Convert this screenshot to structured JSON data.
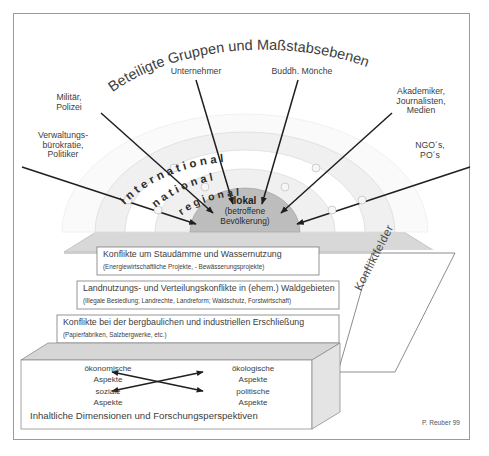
{
  "figure": {
    "title": "Beteiligte Gruppen und Maßstabsebenen",
    "signature": "P. Reuber 99",
    "side_label": "Konfliktfelder",
    "caption": "Inhaltliche Dimensionen und Forschungsperspektiven"
  },
  "actors": [
    {
      "id": "verwaltung",
      "label": "Verwaltungs-\nbürokratie,\nPolitiker"
    },
    {
      "id": "militaer",
      "label": "Militär,\nPolizei"
    },
    {
      "id": "unternehmer",
      "label": "Unternehmer"
    },
    {
      "id": "moenche",
      "label": "Buddh. Mönche"
    },
    {
      "id": "akademiker",
      "label": "Akademiker,\nJournalisten,\nMedien"
    },
    {
      "id": "ngo",
      "label": "NGO´s,\nPO´s"
    }
  ],
  "scales": {
    "bands": [
      {
        "id": "international",
        "label": "international"
      },
      {
        "id": "national",
        "label": "national"
      },
      {
        "id": "regional",
        "label": "regional"
      }
    ],
    "center": {
      "label": "lokal",
      "sublabel_line1": "(betroffene",
      "sublabel_line2": "Bevölkerung)"
    }
  },
  "conflict_fields": [
    {
      "title": "Konflikte um Staudämme und Wassernutzung",
      "subtitle": "(Energiewirtschaftliche Projekte, - Bewässerungsprojekte)"
    },
    {
      "title": "Landnutzungs- und Verteilungskonflikte in (ehem.) Waldgebieten",
      "subtitle": "(Illegale Besiedlung; Landrechte, Landreform; Waldschutz, Forstwirtschaft)"
    },
    {
      "title": "Konflikte bei der bergbaulichen und industriellen Erschließung",
      "subtitle": "(Papierfabriken, Salzbergwerke, etc.)"
    }
  ],
  "dimensions": [
    {
      "id": "oekonomische",
      "line1": "ökonomische",
      "line2": "Aspekte"
    },
    {
      "id": "oekologische",
      "line1": "ökologische",
      "line2": "Aspekte"
    },
    {
      "id": "soziale",
      "line1": "soziale",
      "line2": "Aspekte"
    },
    {
      "id": "politische",
      "line1": "politische",
      "line2": "Aspekte"
    }
  ],
  "colors": {
    "frame_border": "#9a9a9a",
    "band_light": "#f1f1f1",
    "band_white": "#ffffff",
    "center_fill": "#bdbdbd",
    "platform_top": "#d6d6d6",
    "platform_side": "#c9c9c9",
    "box_fill": "#ffffff",
    "text": "#3d3d3d"
  }
}
